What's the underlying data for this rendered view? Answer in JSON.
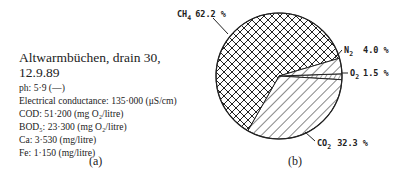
{
  "panel_a": {
    "title_line1": "Altwarmbüchen, drain 30,",
    "title_line2": "12.9.89",
    "parameters": [
      {
        "label": "ph: 5·9 (—)"
      },
      {
        "label": "Electrical conductance: 135·000 (μS/cm)"
      },
      {
        "label": "COD: 51·200  (mg O₂/litre)"
      },
      {
        "label": "BOD₅: 23·300 (mg O₂/litre)"
      },
      {
        "label": "Ca: 3·530 (mg/litre)"
      },
      {
        "label": "Fe: 1·150 (mg/litre)"
      }
    ],
    "caption": "(a)"
  },
  "panel_b": {
    "caption": "(b)"
  },
  "chart_data": {
    "type": "pie",
    "title": "",
    "categories": [
      "CH4",
      "CO2",
      "N2",
      "O2"
    ],
    "values": [
      62.2,
      32.3,
      4.0,
      1.5
    ],
    "unit": "%",
    "labels": [
      {
        "gas": "CH",
        "sub": "4",
        "text": "62.2 %"
      },
      {
        "gas": "CO",
        "sub": "2",
        "text": "32.3 %"
      },
      {
        "gas": "N",
        "sub": "2",
        "text": "4.0 %"
      },
      {
        "gas": "O",
        "sub": "2",
        "text": "1.5 %"
      }
    ],
    "fills": {
      "CH4": "crosshatch",
      "CO2": "diagonal-hatch",
      "N2": "diagonal-hatch",
      "O2": "fine-lines"
    },
    "legend": "none (direct labels with leader lines)"
  }
}
